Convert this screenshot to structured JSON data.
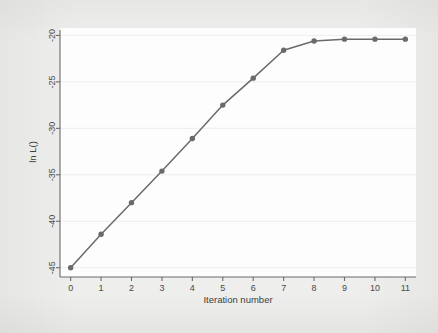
{
  "figure": {
    "background_color": "#eeeeec",
    "panel_color": "#fdfdfd",
    "series_color": "#6a6a6a",
    "axis_color": "#6b6b6b",
    "grid_color": "#e6e6ea"
  },
  "chart_data": {
    "type": "line",
    "title": "",
    "subtitle": "",
    "xlabel": "Iteration number",
    "ylabel": "ln L()",
    "x": [
      0,
      1,
      2,
      3,
      4,
      5,
      6,
      7,
      8,
      9,
      10,
      11
    ],
    "values": [
      -45.0,
      -41.4,
      -38.0,
      -34.6,
      -31.1,
      -27.5,
      -24.6,
      -21.6,
      -20.6,
      -20.4,
      -20.4,
      -20.4
    ],
    "series": [
      {
        "name": "ln L()",
        "values": [
          -45.0,
          -41.4,
          -38.0,
          -34.6,
          -31.1,
          -27.5,
          -24.6,
          -21.6,
          -20.6,
          -20.4,
          -20.4,
          -20.4
        ]
      }
    ],
    "xticks": [
      "0",
      "1",
      "2",
      "3",
      "4",
      "5",
      "6",
      "7",
      "8",
      "9",
      "10",
      "11"
    ],
    "xtick_values": [
      0,
      1,
      2,
      3,
      4,
      5,
      6,
      7,
      8,
      9,
      10,
      11
    ],
    "yticks": [
      "-20",
      "-25",
      "-30",
      "-35",
      "-40",
      "-45"
    ],
    "ytick_values": [
      -20,
      -25,
      -30,
      -35,
      -40,
      -45
    ],
    "xlim": [
      -0.35,
      11.35
    ],
    "ylim": [
      -46.0,
      -19.2
    ],
    "grid": true,
    "grid_axis": "y",
    "legend": false,
    "legend_position": "none",
    "marker": "circle",
    "annotations": []
  }
}
